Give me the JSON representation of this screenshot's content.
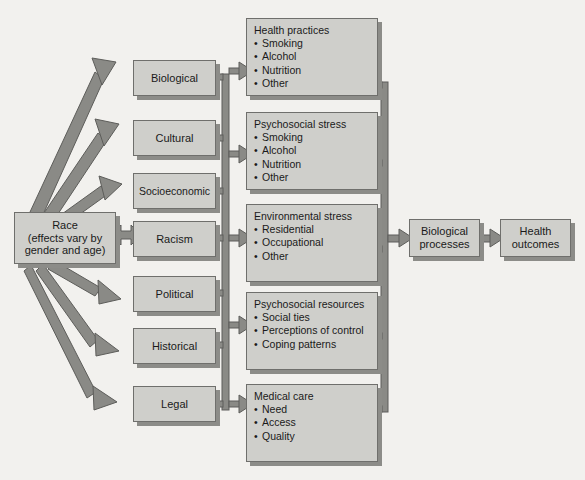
{
  "diagram": {
    "colors": {
      "background": "#f2f1ee",
      "box_fill": "#cfcfcb",
      "box_border": "#6f6f6c",
      "box_shadow": "#8c8c88",
      "arrow_fill": "#8a8a86",
      "arrow_stroke": "#5d5d5a",
      "text": "#1a1a1a"
    },
    "root": {
      "name": "race-box",
      "lines": [
        "Race",
        "(effects vary by",
        "gender and age)"
      ]
    },
    "factors": [
      {
        "name": "biological",
        "label": "Biological"
      },
      {
        "name": "cultural",
        "label": "Cultural"
      },
      {
        "name": "socioeconomic",
        "label": "Socioeconomic"
      },
      {
        "name": "racism",
        "label": "Racism"
      },
      {
        "name": "political",
        "label": "Political"
      },
      {
        "name": "historical",
        "label": "Historical"
      },
      {
        "name": "legal",
        "label": "Legal"
      }
    ],
    "mediators": [
      {
        "name": "health-practices",
        "heading": "Health practices",
        "items": [
          "Smoking",
          "Alcohol",
          "Nutrition",
          "Other"
        ]
      },
      {
        "name": "psychosocial-stress",
        "heading": "Psychosocial stress",
        "items": [
          "Smoking",
          "Alcohol",
          "Nutrition",
          "Other"
        ]
      },
      {
        "name": "environmental-stress",
        "heading": "Environmental stress",
        "items": [
          "Residential",
          "Occupational",
          "Other"
        ]
      },
      {
        "name": "psychosocial-resources",
        "heading": "Psychosocial resources",
        "items": [
          "Social ties",
          "Perceptions of control",
          "Coping patterns"
        ]
      },
      {
        "name": "medical-care",
        "heading": "Medical care",
        "items": [
          "Need",
          "Access",
          "Quality"
        ]
      }
    ],
    "outcomes": [
      {
        "name": "biological-processes",
        "lines": [
          "Biological",
          "processes"
        ]
      },
      {
        "name": "health-outcomes",
        "lines": [
          "Health",
          "outcomes"
        ]
      }
    ],
    "bullet": "•"
  }
}
